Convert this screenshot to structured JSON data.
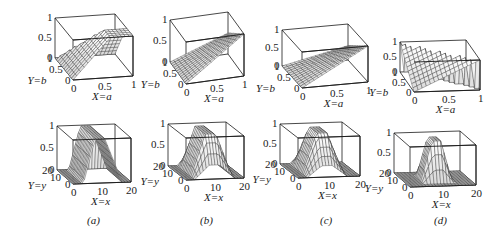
{
  "figure": {
    "panels": [
      {
        "id": "a",
        "caption": "(a)",
        "top": {
          "zlabel_ticks": [
            "1",
            "0.5",
            "0"
          ],
          "ylabel": "Y=b",
          "yticks": [
            "1",
            "0.5",
            "0"
          ],
          "xlabel": "X=a",
          "xticks": [
            "0",
            "0.5",
            "1"
          ]
        },
        "bottom": {
          "zlabel_ticks": [
            "1",
            "0.5",
            "0"
          ],
          "ylabel": "Y=y",
          "yticks": [
            "20",
            "10",
            "0"
          ],
          "xlabel": "X=x",
          "xticks": [
            "0",
            "10",
            "20"
          ]
        }
      },
      {
        "id": "b",
        "caption": "(b)",
        "top": {
          "zlabel_ticks": [
            "1",
            "0.5",
            "0"
          ],
          "ylabel": "Y=b",
          "yticks": [
            "1",
            "0.5",
            "0"
          ],
          "xlabel": "X=a",
          "xticks": [
            "0",
            "0.5",
            "1"
          ]
        },
        "bottom": {
          "zlabel_ticks": [
            "1",
            "0.5",
            "0"
          ],
          "ylabel": "Y=y",
          "yticks": [
            "20",
            "10",
            "0"
          ],
          "xlabel": "X=x",
          "xticks": [
            "0",
            "10",
            "20"
          ]
        }
      },
      {
        "id": "c",
        "caption": "(c)",
        "top": {
          "zlabel_ticks": [
            "1",
            "0.5",
            "0"
          ],
          "ylabel": "Y=b",
          "yticks": [
            "1",
            "0.5",
            "0"
          ],
          "xlabel": "X=a",
          "xticks": [
            "0",
            "0.5",
            "1"
          ]
        },
        "bottom": {
          "zlabel_ticks": [
            "1",
            "0.5",
            "0"
          ],
          "ylabel": "Y=y",
          "yticks": [
            "20",
            "10",
            "0"
          ],
          "xlabel": "X=x",
          "xticks": [
            "0",
            "10",
            "20"
          ]
        }
      },
      {
        "id": "d",
        "caption": "(d)",
        "top": {
          "zlabel_ticks": [
            "1",
            "0.5",
            "0"
          ],
          "ylabel": "Y=b",
          "yticks": [
            "1",
            "0.5",
            "0"
          ],
          "xlabel": "X=a",
          "xticks": [
            "0",
            "0.5",
            "1"
          ]
        },
        "bottom": {
          "zlabel_ticks": [
            "1",
            "0.5",
            "0"
          ],
          "ylabel": "Y=y",
          "yticks": [
            "20",
            "10",
            "0"
          ],
          "xlabel": "X=x",
          "xticks": [
            "0",
            "10",
            "20"
          ]
        }
      }
    ]
  },
  "colors": {
    "ink": "#1a1a1a",
    "mesh": "#2a2a2a",
    "paper": "#ffffff"
  }
}
